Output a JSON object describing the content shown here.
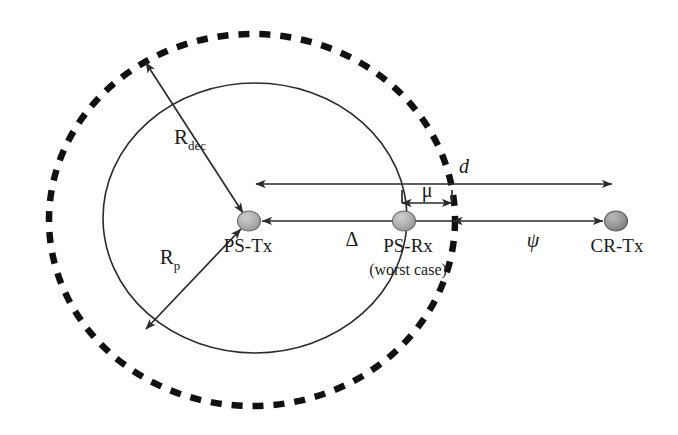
{
  "figure": {
    "background_color": "#ffffff",
    "stroke_color": "#2b2b2b",
    "dashed_stroke_color": "#111111",
    "node_fill_color": "#a8a8a8"
  },
  "nodes": [
    {
      "id": "ps-tx",
      "label": "PS-Tx",
      "sublabel": "",
      "cx": 249,
      "cy": 221,
      "rx": 11,
      "ry": 10,
      "fill": "#a9a9a9"
    },
    {
      "id": "ps-rx",
      "label": "PS-Rx",
      "sublabel": "(worst case)",
      "cx": 404,
      "cy": 221,
      "rx": 11,
      "ry": 10,
      "fill": "#a9a9a9"
    },
    {
      "id": "cr-tx",
      "label": "CR-Tx",
      "sublabel": "",
      "cx": 616,
      "cy": 221,
      "rx": 11,
      "ry": 10,
      "fill": "#8d8d8d"
    }
  ],
  "circles": [
    {
      "id": "protection-circle",
      "style": "solid",
      "cx": 255,
      "cy": 218,
      "rx": 152,
      "ry": 135,
      "radius_label": "R",
      "radius_subscript": "p"
    },
    {
      "id": "decodability-circle",
      "style": "dashed",
      "cx": 252,
      "cy": 220,
      "rx": 203,
      "ry": 186,
      "radius_label": "R",
      "radius_subscript": "dec"
    }
  ],
  "labels": {
    "r_dec": {
      "text": "R",
      "subscript": "dec",
      "x": 196,
      "y": 141
    },
    "r_p": {
      "text": "R",
      "subscript": "p",
      "x": 173,
      "y": 261
    },
    "d": {
      "text": "d",
      "x": 462,
      "y": 172
    },
    "mu": {
      "text": "μ",
      "x": 427,
      "y": 197
    },
    "delta": {
      "text": "Δ",
      "x": 352,
      "y": 243
    },
    "psi": {
      "text": "ψ",
      "x": 532,
      "y": 243
    }
  },
  "measures": [
    {
      "id": "d-measure",
      "label": "d",
      "description": "distance from PS-Tx to CR-Tx measured along upper line",
      "x1": 256,
      "x2": 612,
      "y": 184,
      "arrow_start": true,
      "arrow_end": true
    },
    {
      "id": "mu-measure",
      "label": "μ",
      "description": "gap between PS-Rx and decodability circle edge",
      "x1": 401,
      "x2": 453,
      "y": 203,
      "arrow_start": true,
      "arrow_end": true
    },
    {
      "id": "delta-measure",
      "label": "Δ",
      "description": "distance from decodability circle edge back to PS-Tx",
      "x1": 453,
      "x2": 260,
      "y": 221,
      "arrow_start": false,
      "arrow_end": true
    },
    {
      "id": "psi-measure",
      "label": "ψ",
      "description": "distance from decodability circle edge to CR-Tx",
      "x1": 453,
      "x2": 605,
      "y": 221,
      "arrow_start": false,
      "arrow_end": true
    }
  ],
  "radii": [
    {
      "id": "r-dec-arrow",
      "label": "R_dec",
      "x1": 146,
      "y1": 63,
      "x2": 243,
      "y2": 213,
      "arrow_start": true,
      "arrow_end": true
    },
    {
      "id": "r-p-arrow",
      "label": "R_p",
      "x1": 145,
      "y1": 330,
      "x2": 241,
      "y2": 229,
      "arrow_start": true,
      "arrow_end": true
    }
  ]
}
